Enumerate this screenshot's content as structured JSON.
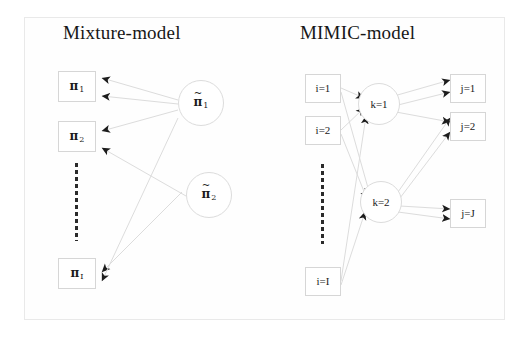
{
  "figure": {
    "background_color": "#ffffff",
    "frame_color": "#e9e9e9",
    "edge_color": "#dcdcdc",
    "arrow_color": "#1c1c1c"
  },
  "panels": [
    {
      "id": "mixture",
      "title": "Mixture-model",
      "left_nodes": [
        {
          "name": "pi-1",
          "symbol": "π",
          "subscript": "1",
          "tilde": false
        },
        {
          "name": "pi-2",
          "symbol": "π",
          "subscript": "2",
          "tilde": false
        },
        {
          "name": "pi-I",
          "symbol": "π",
          "subscript": "I",
          "tilde": false
        }
      ],
      "right_nodes": [
        {
          "name": "pi-tilde-1",
          "symbol": "π",
          "subscript": "1",
          "tilde": true
        },
        {
          "name": "pi-tilde-2",
          "symbol": "π",
          "subscript": "2",
          "tilde": true
        }
      ],
      "ellipsis": "vertical-dashed"
    },
    {
      "id": "mimic",
      "title": "MIMIC-model",
      "input_nodes": [
        {
          "name": "i-1",
          "label": "i=1"
        },
        {
          "name": "i-2",
          "label": "i=2"
        },
        {
          "name": "i-I",
          "label": "i=I"
        }
      ],
      "latent_nodes": [
        {
          "name": "k-1",
          "label": "k=1"
        },
        {
          "name": "k-2",
          "label": "k=2"
        }
      ],
      "output_nodes": [
        {
          "name": "j-1",
          "label": "j=1"
        },
        {
          "name": "j-2",
          "label": "j=2"
        },
        {
          "name": "j-J",
          "label": "j=J"
        }
      ],
      "ellipsis": "vertical-dashed"
    }
  ]
}
